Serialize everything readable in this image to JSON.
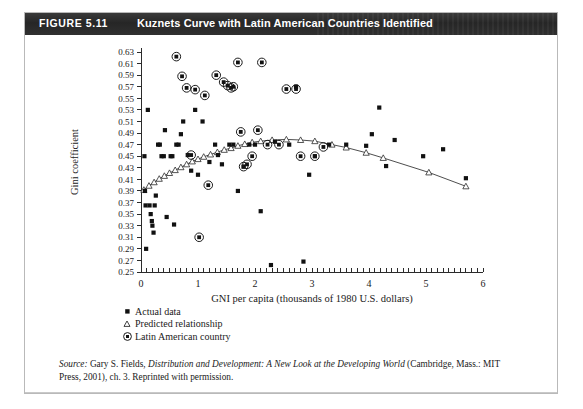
{
  "figure": {
    "label": "FIGURE 5.11",
    "title": "Kuznets Curve with Latin American Countries Identified"
  },
  "legend": {
    "items": [
      {
        "marker": "filled-square",
        "label": "Actual data"
      },
      {
        "marker": "open-triangle",
        "label": "Predicted relationship"
      },
      {
        "marker": "circled-dot",
        "label": "Latin American country"
      }
    ]
  },
  "source": {
    "prefix": "Source:",
    "text_before_italic": " Gary S. Fields, ",
    "italic_title": "Distribution and Development: A New Look at the Developing World",
    "text_after_italic": " (Cambridge, Mass.: MIT Press, 2001), ch. 3. Reprinted with permission."
  },
  "chart_data": {
    "type": "scatter",
    "title": "Kuznets Curve with Latin American Countries Identified",
    "xlabel": "GNI per capita (thousands of 1980 U.S. dollars)",
    "ylabel": "Gini coefficient",
    "xlim": [
      0,
      6
    ],
    "ylim": [
      0.25,
      0.63
    ],
    "xticks": [
      0,
      1,
      2,
      3,
      4,
      5,
      6
    ],
    "xtick_labels": [
      "0",
      "1",
      "2",
      "3",
      "4",
      "5",
      "6"
    ],
    "x_minor_tick_step": 0.1,
    "yticks": [
      0.25,
      0.27,
      0.29,
      0.31,
      0.33,
      0.35,
      0.37,
      0.39,
      0.41,
      0.43,
      0.45,
      0.47,
      0.49,
      0.51,
      0.53,
      0.55,
      0.57,
      0.59,
      0.61,
      0.63
    ],
    "ytick_labels": [
      "0.25",
      "0.27",
      "0.29",
      "0.31",
      "0.33",
      "0.35",
      "0.37",
      "0.39",
      "0.41",
      "0.43",
      "0.45",
      "0.47",
      "0.49",
      "0.51",
      "0.53",
      "0.55",
      "0.57",
      "0.59",
      "0.61",
      "0.63"
    ],
    "grid": false,
    "legend_position": "below-axes-left",
    "series": [
      {
        "name": "Actual data",
        "marker": "filled-square",
        "points": [
          [
            0.06,
            0.45
          ],
          [
            0.07,
            0.39
          ],
          [
            0.08,
            0.365
          ],
          [
            0.09,
            0.29
          ],
          [
            0.15,
            0.365
          ],
          [
            0.17,
            0.35
          ],
          [
            0.19,
            0.338
          ],
          [
            0.2,
            0.33
          ],
          [
            0.22,
            0.318
          ],
          [
            0.24,
            0.365
          ],
          [
            0.26,
            0.382
          ],
          [
            0.12,
            0.53
          ],
          [
            0.3,
            0.47
          ],
          [
            0.33,
            0.47
          ],
          [
            0.36,
            0.45
          ],
          [
            0.4,
            0.45
          ],
          [
            0.42,
            0.495
          ],
          [
            0.45,
            0.345
          ],
          [
            0.52,
            0.45
          ],
          [
            0.55,
            0.45
          ],
          [
            0.58,
            0.332
          ],
          [
            0.62,
            0.47
          ],
          [
            0.66,
            0.47
          ],
          [
            0.7,
            0.488
          ],
          [
            0.74,
            0.51
          ],
          [
            0.82,
            0.452
          ],
          [
            0.88,
            0.425
          ],
          [
            0.95,
            0.53
          ],
          [
            1.0,
            0.418
          ],
          [
            1.08,
            0.51
          ],
          [
            1.2,
            0.44
          ],
          [
            1.3,
            0.47
          ],
          [
            1.35,
            0.452
          ],
          [
            1.42,
            0.436
          ],
          [
            1.55,
            0.47
          ],
          [
            1.62,
            0.47
          ],
          [
            1.7,
            0.39
          ],
          [
            1.8,
            0.432
          ],
          [
            1.9,
            0.47
          ],
          [
            2.0,
            0.47
          ],
          [
            2.1,
            0.355
          ],
          [
            2.28,
            0.262
          ],
          [
            2.35,
            0.475
          ],
          [
            2.6,
            0.47
          ],
          [
            2.72,
            0.57
          ],
          [
            2.85,
            0.268
          ],
          [
            2.95,
            0.418
          ],
          [
            3.05,
            0.45
          ],
          [
            3.3,
            0.47
          ],
          [
            3.6,
            0.47
          ],
          [
            3.95,
            0.468
          ],
          [
            4.05,
            0.488
          ],
          [
            4.18,
            0.534
          ],
          [
            4.3,
            0.433
          ],
          [
            4.45,
            0.478
          ],
          [
            4.95,
            0.45
          ],
          [
            5.3,
            0.462
          ],
          [
            5.7,
            0.412
          ]
        ]
      },
      {
        "name": "Predicted relationship",
        "marker": "open-triangle",
        "points": [
          [
            0.05,
            0.392
          ],
          [
            0.14,
            0.399
          ],
          [
            0.23,
            0.405
          ],
          [
            0.32,
            0.411
          ],
          [
            0.41,
            0.416
          ],
          [
            0.5,
            0.421
          ],
          [
            0.6,
            0.426
          ],
          [
            0.7,
            0.431
          ],
          [
            0.8,
            0.436
          ],
          [
            0.9,
            0.441
          ],
          [
            1.0,
            0.445
          ],
          [
            1.1,
            0.449
          ],
          [
            1.22,
            0.453
          ],
          [
            1.34,
            0.457
          ],
          [
            1.46,
            0.461
          ],
          [
            1.58,
            0.464
          ],
          [
            1.7,
            0.468
          ],
          [
            1.82,
            0.471
          ],
          [
            1.95,
            0.474
          ],
          [
            2.1,
            0.476
          ],
          [
            2.3,
            0.478
          ],
          [
            2.55,
            0.479
          ],
          [
            2.8,
            0.478
          ],
          [
            3.05,
            0.476
          ],
          [
            3.35,
            0.47
          ],
          [
            3.6,
            0.465
          ],
          [
            3.95,
            0.456
          ],
          [
            4.25,
            0.447
          ],
          [
            5.05,
            0.422
          ],
          [
            5.7,
            0.398
          ]
        ]
      },
      {
        "name": "Latin American country",
        "marker": "circled-dot",
        "points": [
          [
            0.62,
            0.622
          ],
          [
            0.72,
            0.588
          ],
          [
            0.8,
            0.568
          ],
          [
            0.88,
            0.452
          ],
          [
            0.95,
            0.565
          ],
          [
            1.02,
            0.31
          ],
          [
            1.12,
            0.555
          ],
          [
            1.18,
            0.4
          ],
          [
            1.32,
            0.59
          ],
          [
            1.45,
            0.578
          ],
          [
            1.52,
            0.572
          ],
          [
            1.58,
            0.568
          ],
          [
            1.62,
            0.57
          ],
          [
            1.7,
            0.612
          ],
          [
            1.75,
            0.492
          ],
          [
            1.8,
            0.432
          ],
          [
            1.86,
            0.436
          ],
          [
            1.95,
            0.45
          ],
          [
            2.05,
            0.495
          ],
          [
            2.12,
            0.612
          ],
          [
            2.22,
            0.47
          ],
          [
            2.42,
            0.47
          ],
          [
            2.55,
            0.566
          ],
          [
            2.72,
            0.566
          ],
          [
            2.8,
            0.45
          ],
          [
            3.05,
            0.45
          ],
          [
            3.2,
            0.466
          ]
        ]
      }
    ]
  }
}
